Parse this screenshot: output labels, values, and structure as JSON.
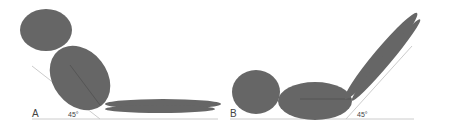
{
  "diagram": {
    "panels": [
      {
        "id": "A",
        "label": "A",
        "angle_label": "45°",
        "description": "Figure reclined with trunk at 45 degrees, legs flat"
      },
      {
        "id": "B",
        "label": "B",
        "angle_label": "45°",
        "description": "Figure lying flat with legs raised at 45 degrees"
      }
    ],
    "colors": {
      "body_fill": "#666666",
      "inner_line": "#555555",
      "guide_line": "#cccccc",
      "label_text": "#444444"
    }
  }
}
